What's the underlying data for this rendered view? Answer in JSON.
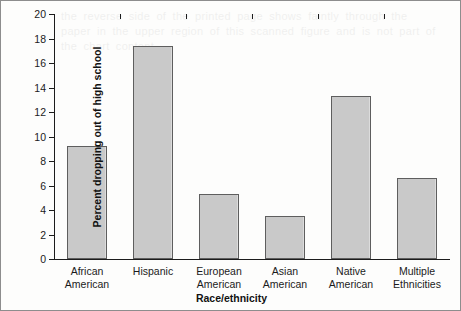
{
  "chart_data": {
    "type": "bar",
    "title": "",
    "xlabel": "Race/ethnicity",
    "ylabel": "Percent dropping out of high school",
    "categories": [
      "African\nAmerican",
      "Hispanic",
      "European\nAmerican",
      "Asian\nAmerican",
      "Native\nAmerican",
      "Multiple\nEthnicities"
    ],
    "values": [
      9.2,
      17.4,
      5.3,
      3.5,
      13.3,
      6.6
    ],
    "ylim": [
      0,
      20
    ],
    "yticks": [
      0,
      2,
      4,
      6,
      8,
      10,
      12,
      14,
      16,
      18,
      20
    ],
    "ytick_labels": [
      "0",
      "2",
      "4",
      "6",
      "8",
      "10",
      "12",
      "14",
      "16",
      "18",
      "20"
    ],
    "grid": false,
    "legend": null,
    "bar_color": "#c9c9c9",
    "bar_edge_color": "#5e5e5e",
    "axis_color": "#1c1c1c"
  },
  "artifacts": {
    "showthrough_text": "the reverse side of the printed page shows faintly through the paper in the upper region of this scanned figure and is not part of the chart content"
  }
}
